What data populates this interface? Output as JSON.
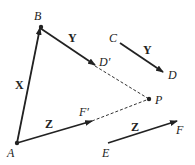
{
  "diagram": {
    "points": {
      "A": {
        "label": "A",
        "x": 17,
        "y": 143
      },
      "B": {
        "label": "B",
        "x": 40,
        "y": 28
      },
      "D_prime": {
        "label": "D′",
        "x": 95,
        "y": 67
      },
      "F_prime": {
        "label": "F′",
        "x": 95,
        "y": 116
      },
      "P": {
        "label": "P",
        "x": 149,
        "y": 99
      },
      "C": {
        "label": "C",
        "x": 120,
        "y": 43
      },
      "D": {
        "label": "D",
        "x": 165,
        "y": 72
      },
      "E": {
        "label": "E",
        "x": 108,
        "y": 143
      },
      "F": {
        "label": "F",
        "x": 180,
        "y": 121
      }
    },
    "vectors": {
      "X": {
        "label": "X",
        "from": "A",
        "to": "B"
      },
      "Y_from_B": {
        "label": "Y",
        "from": "B",
        "to": "D′"
      },
      "Z_from_A": {
        "label": "Z",
        "from": "A",
        "to": "F′"
      },
      "Y_CD": {
        "label": "Y",
        "from": "C",
        "to": "D"
      },
      "Z_EF": {
        "label": "Z",
        "from": "E",
        "to": "F"
      }
    },
    "dashed": [
      "D′–P",
      "F′–P"
    ],
    "colors": {
      "ink": "#222222",
      "background": "#ffffff"
    }
  }
}
